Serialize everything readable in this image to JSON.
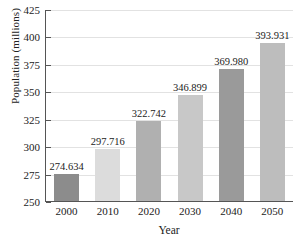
{
  "chart_data": {
    "type": "bar",
    "title": "",
    "xlabel": "Year",
    "ylabel": "Population (millions)",
    "categories": [
      "2000",
      "2010",
      "2020",
      "2030",
      "2040",
      "2050"
    ],
    "values": [
      274.634,
      297.716,
      322.742,
      346.899,
      369.98,
      393.931
    ],
    "value_labels": [
      "274.634",
      "297.716",
      "322.742",
      "346.899",
      "369.980",
      "393.931"
    ],
    "ylim": [
      250,
      425
    ],
    "ytick_labels": [
      "250",
      "275",
      "300",
      "325",
      "350",
      "375",
      "400",
      "425"
    ],
    "yticks": [
      250,
      275,
      300,
      325,
      350,
      375,
      400,
      425
    ],
    "grid": true,
    "legend": "none",
    "bar_colors": [
      "#8c8c8c",
      "#dcdcdc",
      "#b0b0b0",
      "#c8c8c8",
      "#9a9a9a",
      "#bdbdbd"
    ],
    "axis_color": "#555555",
    "grid_color": "#e2e2e2"
  }
}
